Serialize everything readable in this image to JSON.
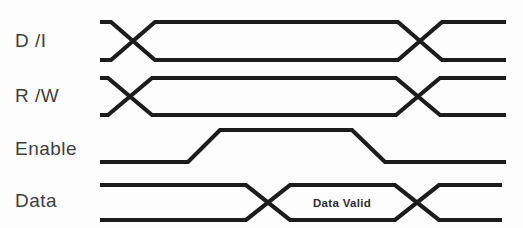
{
  "diagram": {
    "background_color": "#fdfdfd",
    "line_color": "#1c1c1c",
    "label_color": "#3f3f3f",
    "width": 523,
    "height": 228,
    "signals": [
      {
        "name": "di",
        "label": "D /I",
        "type": "bus",
        "label_x": 15,
        "label_y": 31,
        "top_y": 22,
        "bottom_y": 60,
        "x_start": 100,
        "x_end": 506,
        "crossings": [
          133,
          420
        ],
        "cross_half_width": 22
      },
      {
        "name": "rw",
        "label": "R /W",
        "type": "bus",
        "label_x": 15,
        "label_y": 86,
        "top_y": 78,
        "bottom_y": 115,
        "x_start": 100,
        "x_end": 506,
        "crossings": [
          130,
          418
        ],
        "cross_half_width": 22
      },
      {
        "name": "enable",
        "label": "Enable",
        "type": "pulse",
        "label_x": 15,
        "label_y": 139,
        "low_y": 162,
        "high_y": 130,
        "x_start": 100,
        "x_end": 506,
        "rise_start": 188,
        "rise_end": 220,
        "fall_start": 352,
        "fall_end": 385
      },
      {
        "name": "data",
        "label": "Data",
        "type": "bus",
        "label_x": 15,
        "label_y": 191,
        "top_y": 185,
        "bottom_y": 220,
        "x_start": 100,
        "x_end": 502,
        "crossings": [
          268,
          417
        ],
        "cross_half_width": 22,
        "annotation": {
          "text": "Data Valid",
          "x": 342,
          "y": 207
        }
      }
    ]
  }
}
